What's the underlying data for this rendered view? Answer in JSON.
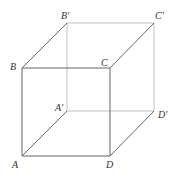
{
  "diagram": {
    "type": "cube",
    "vertices": {
      "A": {
        "label": "A",
        "x": 22,
        "y": 156
      },
      "B": {
        "label": "B",
        "x": 22,
        "y": 68
      },
      "C": {
        "label": "C",
        "x": 110,
        "y": 68
      },
      "D": {
        "label": "D",
        "x": 110,
        "y": 156
      },
      "A2": {
        "label": "A′",
        "x": 67,
        "y": 111
      },
      "B2": {
        "label": "B′",
        "x": 67,
        "y": 23
      },
      "C2": {
        "label": "C′",
        "x": 154,
        "y": 23
      },
      "D2": {
        "label": "D′",
        "x": 154,
        "y": 111
      }
    },
    "colors": {
      "front_edge": "#555555",
      "back_edge": "#aaaaaa",
      "label": "#333333"
    }
  }
}
